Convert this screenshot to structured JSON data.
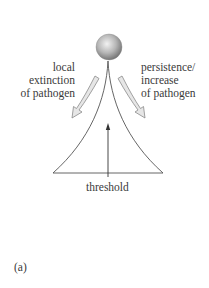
{
  "figure": {
    "panel_label": "(a)",
    "left_annotation": {
      "lines": [
        "local",
        "extinction",
        "of pathogen"
      ]
    },
    "right_annotation": {
      "lines": [
        "persistence/",
        "increase",
        "of pathogen"
      ]
    },
    "threshold_label": "threshold",
    "colors": {
      "line": "#555555",
      "arrow_fill": "#e6e6e6",
      "arrow_stroke": "#8a8a8a",
      "ball_light": "#f0f0f0",
      "ball_dark": "#7a7a7a",
      "text": "#3a3a3a"
    }
  }
}
